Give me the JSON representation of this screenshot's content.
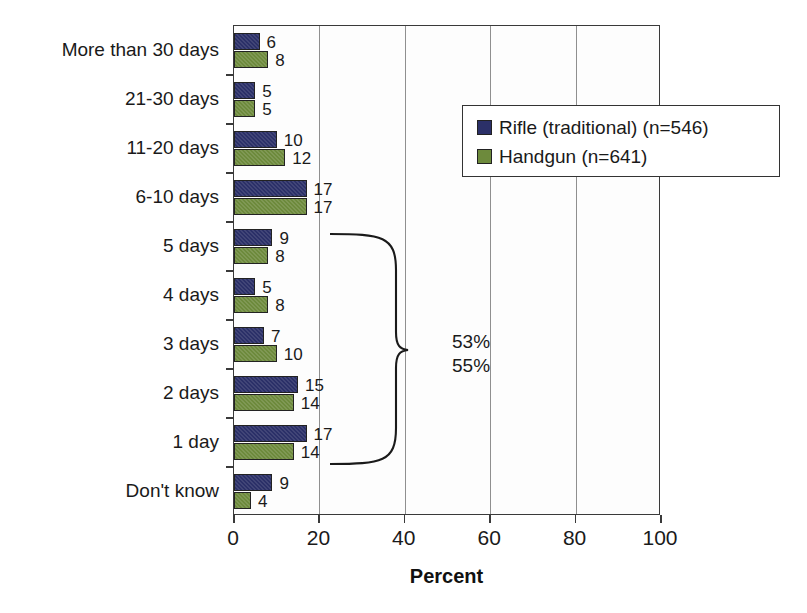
{
  "chart_data": {
    "type": "bar",
    "orientation": "horizontal",
    "title": "",
    "xlabel": "Percent",
    "ylabel": "",
    "xlim": [
      0,
      100
    ],
    "xticks": [
      0,
      20,
      40,
      60,
      80,
      100
    ],
    "grid": true,
    "grid_axis": "x",
    "legend_position": "upper-right",
    "categories": [
      "More than 30 days",
      "21-30 days",
      "11-20 days",
      "6-10 days",
      "5 days",
      "4 days",
      "3 days",
      "2 days",
      "1 day",
      "Don't know"
    ],
    "series": [
      {
        "name": "Rifle (traditional) (n=546)",
        "color": "#2b3068",
        "values": [
          6,
          5,
          10,
          17,
          9,
          5,
          7,
          15,
          17,
          9
        ]
      },
      {
        "name": "Handgun (n=641)",
        "color": "#6d8a3c",
        "values": [
          8,
          5,
          12,
          17,
          8,
          8,
          10,
          14,
          14,
          4
        ]
      }
    ],
    "annotations": [
      {
        "type": "brace",
        "labels": [
          "53%",
          "55%"
        ],
        "spans_categories": [
          "5 days",
          "4 days",
          "3 days",
          "2 days",
          "1 day"
        ]
      }
    ]
  },
  "axis": {
    "x_title": "Percent"
  },
  "legend": {
    "entries": [
      {
        "label": "Rifle (traditional) (n=546)",
        "swatch": "series-0"
      },
      {
        "label": "Handgun (n=641)",
        "swatch": "series-1"
      }
    ]
  },
  "annotation": {
    "line1": "53%",
    "line2": "55%"
  }
}
